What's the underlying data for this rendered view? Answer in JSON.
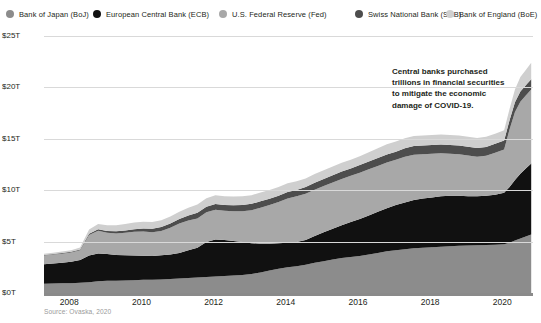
{
  "legend": {
    "items": [
      {
        "label": "Bank of Japan (BoJ)",
        "color": "#8c8c8c",
        "key": "boj"
      },
      {
        "label": "European Central Bank (ECB)",
        "color": "#111111",
        "key": "ecb"
      },
      {
        "label": "U.S. Federal Reserve (Fed)",
        "color": "#a8a8a8",
        "key": "fed"
      },
      {
        "label": "Swiss National Bank (SNB)",
        "color": "#4d4d4d",
        "key": "snb"
      },
      {
        "label": "Bank of England (BoE)",
        "color": "#cfcfcf",
        "key": "boe"
      }
    ]
  },
  "annotation": {
    "line1": "Central banks purchased",
    "line2": "trillions in financial securities",
    "line3": "to mitigate the economic",
    "line4": "damage of COVID-19."
  },
  "source": "Source: Ovaska, 2020",
  "chart_data": {
    "type": "area",
    "stacked": true,
    "title": "",
    "subtitle": "",
    "xlabel": "",
    "ylabel": "",
    "xlim": [
      2007.3,
      2020.85
    ],
    "ylim": [
      0,
      25
    ],
    "yunit": "$T",
    "grid": true,
    "legend_position": "top",
    "ytick_labels": [
      "$0T",
      "$5T",
      "$10T",
      "$15T",
      "$20T",
      "$25T"
    ],
    "ytick_values": [
      0,
      5,
      10,
      15,
      20,
      25
    ],
    "xtick_labels": [
      "2008",
      "2010",
      "2012",
      "2014",
      "2016",
      "2018",
      "2020"
    ],
    "xtick_values": [
      2008,
      2010,
      2012,
      2014,
      2016,
      2018,
      2020
    ],
    "x": [
      2007.3,
      2007.55,
      2007.8,
      2008.05,
      2008.3,
      2008.55,
      2008.8,
      2009.05,
      2009.3,
      2009.55,
      2009.8,
      2010.05,
      2010.3,
      2010.55,
      2010.8,
      2011.05,
      2011.3,
      2011.55,
      2011.8,
      2012.05,
      2012.3,
      2012.55,
      2012.8,
      2013.05,
      2013.3,
      2013.55,
      2013.8,
      2014.05,
      2014.3,
      2014.55,
      2014.8,
      2015.05,
      2015.3,
      2015.55,
      2015.8,
      2016.05,
      2016.3,
      2016.55,
      2016.8,
      2017.05,
      2017.3,
      2017.55,
      2017.8,
      2018.05,
      2018.3,
      2018.55,
      2018.8,
      2019.05,
      2019.3,
      2019.55,
      2019.8,
      2020.05,
      2020.2,
      2020.35,
      2020.5,
      2020.65,
      2020.8
    ],
    "series": [
      {
        "name": "Bank of Japan (BoJ)",
        "color": "#8c8c8c",
        "values": [
          0.9,
          0.92,
          0.95,
          0.95,
          1.0,
          1.05,
          1.15,
          1.2,
          1.2,
          1.22,
          1.25,
          1.28,
          1.3,
          1.32,
          1.35,
          1.4,
          1.45,
          1.5,
          1.55,
          1.6,
          1.65,
          1.7,
          1.75,
          1.85,
          2.0,
          2.2,
          2.35,
          2.5,
          2.6,
          2.75,
          2.95,
          3.1,
          3.25,
          3.4,
          3.5,
          3.6,
          3.75,
          3.9,
          4.05,
          4.15,
          4.25,
          4.35,
          4.4,
          4.45,
          4.5,
          4.55,
          4.6,
          4.62,
          4.65,
          4.68,
          4.7,
          4.75,
          4.9,
          5.1,
          5.3,
          5.5,
          5.7
        ]
      },
      {
        "name": "European Central Bank (ECB)",
        "color": "#111111",
        "values": [
          1.9,
          1.95,
          2.0,
          2.1,
          2.2,
          2.6,
          2.7,
          2.6,
          2.5,
          2.45,
          2.4,
          2.35,
          2.3,
          2.35,
          2.4,
          2.5,
          2.7,
          2.9,
          3.4,
          3.6,
          3.5,
          3.35,
          3.2,
          3.0,
          2.8,
          2.6,
          2.5,
          2.4,
          2.35,
          2.4,
          2.6,
          2.8,
          3.0,
          3.2,
          3.4,
          3.6,
          3.8,
          4.0,
          4.2,
          4.4,
          4.55,
          4.7,
          4.8,
          4.85,
          4.9,
          4.9,
          4.85,
          4.8,
          4.75,
          4.78,
          4.85,
          5.0,
          5.4,
          5.9,
          6.3,
          6.6,
          6.9
        ]
      },
      {
        "name": "U.S. Federal Reserve (Fed)",
        "color": "#a8a8a8",
        "values": [
          0.85,
          0.87,
          0.88,
          0.9,
          0.95,
          2.0,
          2.2,
          2.05,
          2.1,
          2.2,
          2.3,
          2.35,
          2.3,
          2.35,
          2.6,
          2.85,
          2.9,
          2.85,
          2.9,
          2.9,
          2.85,
          2.9,
          3.0,
          3.2,
          3.5,
          3.75,
          4.0,
          4.3,
          4.45,
          4.5,
          4.5,
          4.5,
          4.5,
          4.5,
          4.5,
          4.5,
          4.5,
          4.45,
          4.45,
          4.4,
          4.45,
          4.4,
          4.3,
          4.25,
          4.2,
          4.1,
          4.05,
          3.95,
          3.85,
          3.9,
          4.1,
          4.2,
          5.6,
          6.6,
          7.0,
          7.1,
          7.2
        ]
      },
      {
        "name": "Swiss National Bank (SNB)",
        "color": "#4d4d4d",
        "values": [
          0.05,
          0.05,
          0.06,
          0.07,
          0.08,
          0.12,
          0.15,
          0.18,
          0.2,
          0.22,
          0.25,
          0.3,
          0.35,
          0.4,
          0.42,
          0.45,
          0.5,
          0.55,
          0.55,
          0.55,
          0.55,
          0.58,
          0.6,
          0.62,
          0.62,
          0.62,
          0.62,
          0.62,
          0.62,
          0.65,
          0.68,
          0.7,
          0.7,
          0.72,
          0.72,
          0.75,
          0.75,
          0.78,
          0.78,
          0.8,
          0.82,
          0.85,
          0.85,
          0.85,
          0.85,
          0.85,
          0.85,
          0.85,
          0.85,
          0.85,
          0.86,
          0.88,
          0.9,
          0.95,
          1.0,
          1.0,
          1.0
        ]
      },
      {
        "name": "Bank of England (BoE)",
        "color": "#cfcfcf",
        "values": [
          0.12,
          0.13,
          0.14,
          0.15,
          0.2,
          0.4,
          0.5,
          0.55,
          0.6,
          0.62,
          0.65,
          0.65,
          0.65,
          0.65,
          0.68,
          0.7,
          0.75,
          0.8,
          0.82,
          0.85,
          0.85,
          0.85,
          0.85,
          0.85,
          0.85,
          0.85,
          0.85,
          0.85,
          0.85,
          0.85,
          0.85,
          0.85,
          0.85,
          0.85,
          0.85,
          0.85,
          0.9,
          0.95,
          0.98,
          0.98,
          0.98,
          0.98,
          0.98,
          0.98,
          0.98,
          0.98,
          0.98,
          0.98,
          0.98,
          0.98,
          0.98,
          1.0,
          1.1,
          1.25,
          1.4,
          1.5,
          1.6
        ]
      }
    ],
    "totals_note": "Combined balance sheets rise from about $3.8T in 2007 to about $21T in late 2020."
  }
}
